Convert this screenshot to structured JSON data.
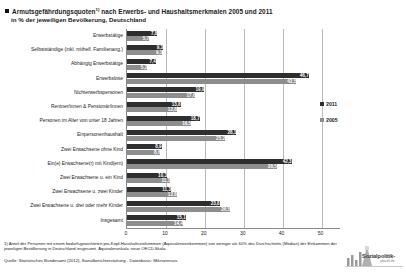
{
  "title": {
    "line1": "Armutsgefährdungsquoten",
    "footnote_marker": "1)",
    "line1_rest": " nach Erwerbs- und Haushaltsmerkmalen  2005 und 2011",
    "line2": "in % der jeweiligen Bevölkerung, Deutschland"
  },
  "legend": {
    "items": [
      {
        "label": "2011",
        "color": "#2e2e2e"
      },
      {
        "label": "2005",
        "color": "#8d8d8d"
      }
    ]
  },
  "footnotes": {
    "note1": "1) Anteil der Personen mit einem bedarfsgewichteten pro-Kopf-Haushaltseinkommen (Äquivalenzeinkommen) von weniger als 60% des Durchschnitts (Median) der Einkommen  der jeweiligen Bevölkerung in Deutschland insgesamt. Äquivalenzskala: neue OECD-Skala.",
    "source": "Quelle: Statistisches Bundesamt (2012), Sozialberichterstattung - Datenbasis: Mikrozensus"
  },
  "logo": {
    "name": "Sozialpolitik-",
    "sub": "aktuell.de"
  },
  "chart_data": {
    "type": "bar",
    "orientation": "horizontal",
    "xlabel": "",
    "ylabel": "",
    "xlim": [
      0,
      55
    ],
    "xticks": [
      0,
      10,
      20,
      30,
      40,
      50
    ],
    "grid": true,
    "legend_position": "right",
    "categories": [
      "Erwerbstätige",
      "Selbstständige (inkl. mithelf. Familienang.)",
      "Abhängig Erwerbstätige",
      "Erwerbslose",
      "Nichterwerbspersonen",
      "Rentner/innen & Pensionär/innen",
      "Personen im Alter von unter 18 Jahren",
      "Einpersonenhaushalt",
      "Zwei Erwachsene ohne Kind",
      "Ein(e) Erwachsene(r) mit Kind(ern)",
      "Zwei Erwachsene u. ein Kind",
      "Zwei Erwachsene u. zwei Kinder",
      "Zwei Erwachsene u. drei oder mehr Kinder",
      "Insgesamt"
    ],
    "series": [
      {
        "name": "2011",
        "color": "#2e2e2e",
        "values": [
          7.8,
          9.3,
          7.4,
          46.7,
          19.9,
          13.8,
          18.7,
          28.1,
          8.9,
          42.3,
          10.3,
          11.3,
          23.8,
          15.1
        ]
      },
      {
        "name": "2005",
        "color": "#8d8d8d",
        "values": [
          5.7,
          9.1,
          5.2,
          43.5,
          17.6,
          12.8,
          16.5,
          25.2,
          8.6,
          38.5,
          11.1,
          12.8,
          26.5,
          14.4
        ]
      }
    ]
  }
}
